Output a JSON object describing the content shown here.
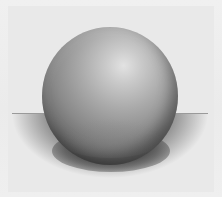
{
  "image": {
    "subject": "pencil drawing of a shaded sphere on a surface",
    "description": "Graphite sketch of a sphere resting on a flat plane with a horizon line and a cast shadow; highlight at upper right",
    "colors": {
      "paper": "#ededed",
      "highlight": "#e2e2e2",
      "midtone": "#8a8a8a",
      "core_shadow": "#2c2c2c",
      "horizon_line": "#9a9a9a"
    }
  }
}
